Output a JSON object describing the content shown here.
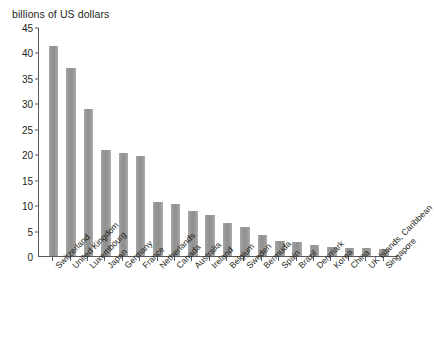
{
  "axis": {
    "y_title": "billions of US dollars",
    "y_ticks": [
      "45",
      "40",
      "35",
      "30",
      "25",
      "20",
      "15",
      "10",
      "5",
      "0"
    ]
  },
  "chart_data": {
    "type": "bar",
    "title": "",
    "subtitle": "",
    "xlabel": "",
    "ylabel": "billions of US dollars",
    "ylim": [
      0,
      45
    ],
    "ytick_step": 5,
    "grid": false,
    "legend": "none",
    "bar_color": "#999999",
    "axis_color": "#58595b",
    "categories": [
      "Switzerland",
      "United Kingdom",
      "Luxembourg",
      "Japan",
      "Germany",
      "France",
      "Netherlands",
      "Canada",
      "Australia",
      "Ireland",
      "Belgium",
      "Sweden",
      "Bermuda",
      "Spain",
      "Brazil",
      "Denmark",
      "Korea",
      "China",
      "UK Islands, Caribbean",
      "Singapore"
    ],
    "values": [
      41.3,
      37.0,
      28.8,
      20.8,
      20.3,
      19.6,
      10.7,
      10.3,
      8.8,
      8.0,
      6.5,
      5.8,
      4.2,
      2.9,
      2.8,
      2.2,
      1.8,
      1.6,
      1.5,
      1.4
    ]
  }
}
